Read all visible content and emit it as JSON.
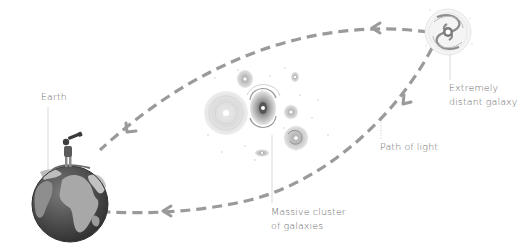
{
  "labels": {
    "earth": "Earth",
    "distant_galaxy": [
      "Extremely",
      "distant galaxy"
    ],
    "path_of_light": "Path of light",
    "massive_cluster": [
      "Massive cluster",
      "of galaxies"
    ]
  },
  "objects": {
    "earth": {
      "icon": "earth-globe-icon",
      "observer": "person-with-telescope-icon"
    },
    "distant_galaxy": {
      "icon": "spiral-galaxy-icon"
    },
    "cluster": {
      "icon": "galaxy-cluster-icon",
      "count": 7
    }
  },
  "paths": [
    {
      "name": "upper-light-path",
      "from": "distant galaxy",
      "to": "earth",
      "arrows": 2
    },
    {
      "name": "lower-light-path",
      "from": "distant galaxy",
      "to": "earth",
      "arrows": 2
    }
  ],
  "colors": {
    "path": "#9a9a9a",
    "text": "#6a6a6a",
    "leader": "#c8c8c8",
    "ocean": "#4a4a4a",
    "land": "#9c9c9c",
    "galaxy_light": "#d4d4d4",
    "galaxy_dark": "#8a8a8a"
  }
}
